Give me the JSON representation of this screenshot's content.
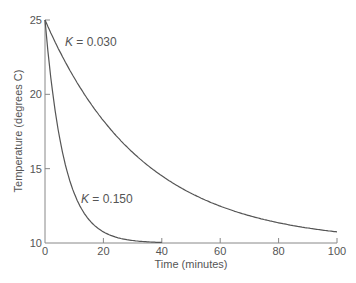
{
  "chart_data": {
    "type": "line",
    "title": "",
    "xlabel": "Time (minutes)",
    "ylabel": "Temperature (degrees C)",
    "xlim": [
      0,
      100
    ],
    "ylim": [
      10,
      25
    ],
    "xticks": [
      0,
      20,
      40,
      60,
      80,
      100
    ],
    "yticks": [
      10,
      15,
      20,
      25
    ],
    "grid": false,
    "legend": "none (inline curve annotations)",
    "model": "T(t) = 10 + 15 * exp(-K * t)",
    "series": [
      {
        "name": "K = 0.030",
        "k": 0.03,
        "x": [
          0,
          10,
          20,
          30,
          40,
          50,
          60,
          70,
          80,
          90,
          100
        ],
        "values": [
          25.0,
          21.1,
          18.2,
          16.1,
          14.5,
          13.3,
          12.5,
          11.8,
          11.4,
          11.0,
          10.7
        ]
      },
      {
        "name": "K = 0.150",
        "k": 0.15,
        "x": [
          0,
          5,
          10,
          15,
          20,
          25,
          30,
          35,
          40
        ],
        "values": [
          25.0,
          17.1,
          13.3,
          11.6,
          10.7,
          10.4,
          10.2,
          10.1,
          10.0
        ]
      }
    ],
    "annotations": [
      {
        "text_k": "K",
        "text_rest": " = 0.030",
        "series": 0
      },
      {
        "text_k": "K",
        "text_rest": " = 0.150",
        "series": 1
      }
    ]
  },
  "colors": {
    "axis": "#888888",
    "curve": "#555555",
    "text": "#555555"
  }
}
